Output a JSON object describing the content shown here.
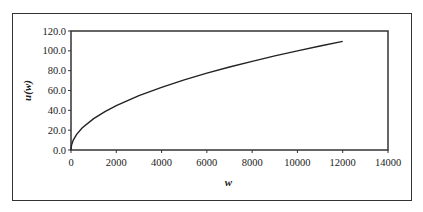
{
  "chart_data": {
    "type": "line",
    "title": "",
    "xlabel": "w",
    "ylabel": "u(w)",
    "xlim": [
      0,
      14000
    ],
    "ylim": [
      0,
      120
    ],
    "xticks": [
      "0",
      "2000",
      "4000",
      "6000",
      "8000",
      "10000",
      "12000",
      "14000"
    ],
    "yticks": [
      "0.0",
      "20.0",
      "40.0",
      "60.0",
      "80.0",
      "100.0",
      "120.0"
    ],
    "grid": false,
    "legend": null,
    "series": [
      {
        "name": "u(w)",
        "x": [
          0,
          25,
          100,
          250,
          500,
          1000,
          1500,
          2000,
          3000,
          4000,
          5000,
          6000,
          7000,
          8000,
          9000,
          10000,
          11000,
          12000
        ],
        "values": [
          0.0,
          5.0,
          10.0,
          15.8,
          22.4,
          31.6,
          38.7,
          44.7,
          54.8,
          63.2,
          70.7,
          77.5,
          83.7,
          89.4,
          94.9,
          100.0,
          104.9,
          109.5
        ]
      }
    ],
    "colors": {
      "line": "#222222",
      "axis": "#333333",
      "frame": "#333333"
    }
  }
}
